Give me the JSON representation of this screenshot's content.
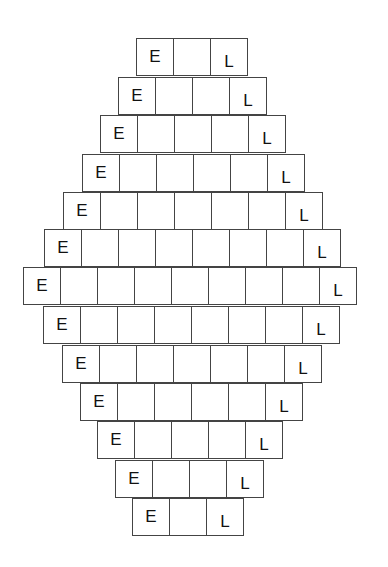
{
  "worksheet": {
    "start_letter": "E",
    "end_letter": "L",
    "rows": [
      {
        "cells": [
          "E",
          "",
          "L"
        ]
      },
      {
        "cells": [
          "E",
          "",
          "",
          "L"
        ]
      },
      {
        "cells": [
          "E",
          "",
          "",
          "",
          "L"
        ]
      },
      {
        "cells": [
          "E",
          "",
          "",
          "",
          "",
          "L"
        ]
      },
      {
        "cells": [
          "E",
          "",
          "",
          "",
          "",
          "",
          "L"
        ]
      },
      {
        "cells": [
          "E",
          "",
          "",
          "",
          "",
          "",
          "",
          "L"
        ]
      },
      {
        "cells": [
          "E",
          "",
          "",
          "",
          "",
          "",
          "",
          "",
          "L"
        ]
      },
      {
        "cells": [
          "E",
          "",
          "",
          "",
          "",
          "",
          "",
          "L"
        ]
      },
      {
        "cells": [
          "E",
          "",
          "",
          "",
          "",
          "",
          "L"
        ]
      },
      {
        "cells": [
          "E",
          "",
          "",
          "",
          "",
          "L"
        ]
      },
      {
        "cells": [
          "E",
          "",
          "",
          "",
          "L"
        ]
      },
      {
        "cells": [
          "E",
          "",
          "",
          "L"
        ]
      },
      {
        "cells": [
          "E",
          "",
          "L"
        ]
      }
    ]
  }
}
